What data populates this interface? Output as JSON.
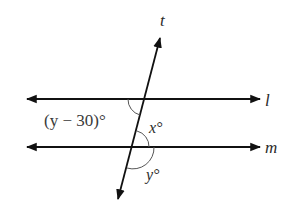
{
  "diagram": {
    "type": "parallel-lines-transversal",
    "lines": {
      "l": {
        "label": "l",
        "y": 99
      },
      "m": {
        "label": "m",
        "y": 147
      },
      "t": {
        "label": "t"
      }
    },
    "angles": {
      "top_left": {
        "label": "(y − 30)°"
      },
      "between": {
        "label": "x°"
      },
      "bottom": {
        "label": "y°"
      }
    },
    "colors": {
      "line": "#111111",
      "arc": "#555555",
      "text": "#2b2b2b"
    }
  }
}
